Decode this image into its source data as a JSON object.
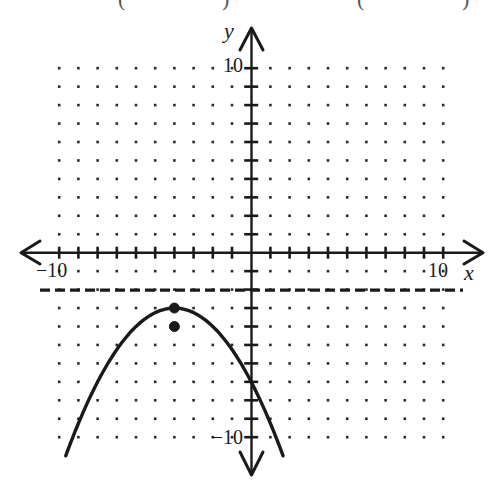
{
  "chart_data": {
    "type": "line",
    "title": "",
    "xlabel": "x",
    "ylabel": "y",
    "xlim": [
      -10,
      10
    ],
    "ylim": [
      -10,
      10
    ],
    "grid": "dots at every integer lattice point",
    "x_tick_labels": [
      {
        "value": -10,
        "label": "−10"
      },
      {
        "value": 10,
        "label": "10"
      }
    ],
    "y_tick_labels": [
      {
        "value": 10,
        "label": "10"
      },
      {
        "value": -10,
        "label": "−10"
      }
    ],
    "series": [
      {
        "name": "parabola",
        "style": "solid",
        "equation": "y = -(1/4)(x + 4)^2 - 3",
        "vertex": [
          -4,
          -3
        ],
        "opens": "down",
        "x_range": [
          -9.66,
          1.66
        ],
        "x": [
          -9.66,
          -8,
          -6,
          -4,
          -2,
          0,
          1.66
        ],
        "values": [
          -11,
          -7,
          -4,
          -3,
          -4,
          -7,
          -11
        ]
      },
      {
        "name": "horizontal-dashed-line",
        "style": "dashed",
        "equation": "y = -2",
        "x_range": [
          -11.0,
          11.0
        ],
        "values": [
          -2,
          -2
        ]
      }
    ],
    "points": [
      {
        "name": "vertex-point",
        "x": -4,
        "y": -3,
        "filled": true
      },
      {
        "name": "point-below-vertex",
        "x": -4,
        "y": -4,
        "filled": true
      }
    ]
  },
  "labels": {
    "x_axis": "x",
    "y_axis": "y",
    "x_min": "−10",
    "x_max": "10",
    "y_max": "10",
    "y_min": "−10",
    "top_fragment_left": "(",
    "top_fragment_mid1": ")",
    "top_fragment_mid2": "(",
    "top_fragment_right": ")"
  },
  "colors": {
    "ink": "#1a1a1a",
    "dots": "#2a2a2a",
    "background": "#ffffff"
  }
}
